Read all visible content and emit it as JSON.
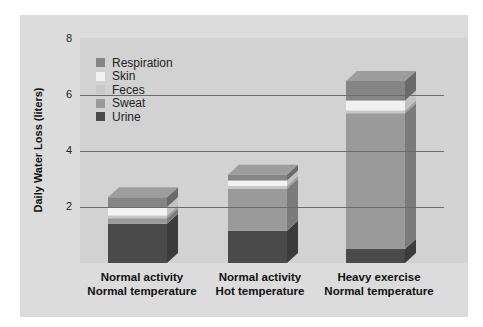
{
  "chart_data": {
    "type": "bar",
    "stacked": true,
    "three_d": true,
    "title": "",
    "xlabel": "",
    "ylabel": "Daily Water Loss (liters)",
    "ylim": [
      0,
      8
    ],
    "yticks": [
      2,
      4,
      6,
      8
    ],
    "grid": true,
    "legend_position": "upper-left",
    "categories": [
      "Normal activity Normal temperature",
      "Normal activity Hot temperature",
      "Heavy exercise Normal temperature"
    ],
    "category_lines": [
      [
        "Normal activity",
        "Normal temperature"
      ],
      [
        "Normal activity",
        "Hot temperature"
      ],
      [
        "Heavy exercise",
        "Normal temperature"
      ]
    ],
    "series": [
      {
        "name": "Urine",
        "color": "#4a4a4a",
        "values": [
          1.4,
          1.15,
          0.5
        ]
      },
      {
        "name": "Sweat",
        "color": "#9a9a9a",
        "values": [
          0.2,
          1.5,
          4.85
        ]
      },
      {
        "name": "Feces",
        "color": "#c8c8c8",
        "values": [
          0.1,
          0.1,
          0.1
        ]
      },
      {
        "name": "Skin",
        "color": "#f2f2f2",
        "values": [
          0.3,
          0.2,
          0.35
        ]
      },
      {
        "name": "Respiration",
        "color": "#858585",
        "values": [
          0.35,
          0.2,
          0.7
        ]
      }
    ],
    "totals": [
      2.35,
      3.15,
      6.5
    ]
  },
  "legend": [
    {
      "name": "Respiration",
      "color": "#858585"
    },
    {
      "name": "Skin",
      "color": "#f2f2f2"
    },
    {
      "name": "Feces",
      "color": "#c8c8c8"
    },
    {
      "name": "Sweat",
      "color": "#9a9a9a"
    },
    {
      "name": "Urine",
      "color": "#4a4a4a"
    }
  ],
  "axis": {
    "ylabel": "Daily Water Loss (liters)",
    "ticks": [
      "8",
      "6",
      "4",
      "2"
    ]
  },
  "xlabels": [
    {
      "line1": "Normal activity",
      "line2": "Normal temperature"
    },
    {
      "line1": "Normal activity",
      "line2": "Hot temperature"
    },
    {
      "line1": "Heavy exercise",
      "line2": "Normal temperature"
    }
  ]
}
